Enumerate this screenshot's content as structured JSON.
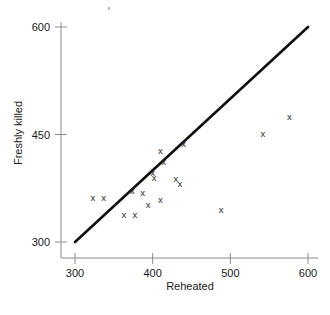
{
  "chart_data": {
    "type": "scatter",
    "title": "",
    "xlabel": "Reheated",
    "ylabel": "Freshly killed",
    "xlim": [
      285,
      615
    ],
    "ylim": [
      285,
      615
    ],
    "xticks": [
      300,
      400,
      500,
      600
    ],
    "yticks": [
      300,
      450,
      600
    ],
    "xtick_labels": [
      "300",
      "400",
      "500",
      "600"
    ],
    "ytick_labels": [
      "300",
      "450",
      "600"
    ],
    "grid": false,
    "legend": null,
    "marker_symbol": "x",
    "points": [
      {
        "x": 323,
        "y": 362
      },
      {
        "x": 337,
        "y": 362
      },
      {
        "x": 363,
        "y": 338
      },
      {
        "x": 377,
        "y": 338
      },
      {
        "x": 374,
        "y": 372
      },
      {
        "x": 387,
        "y": 369
      },
      {
        "x": 394,
        "y": 352
      },
      {
        "x": 400,
        "y": 397
      },
      {
        "x": 402,
        "y": 390
      },
      {
        "x": 410,
        "y": 359
      },
      {
        "x": 410,
        "y": 427
      },
      {
        "x": 414,
        "y": 412
      },
      {
        "x": 430,
        "y": 388
      },
      {
        "x": 435,
        "y": 381
      },
      {
        "x": 440,
        "y": 437
      },
      {
        "x": 488,
        "y": 345
      },
      {
        "x": 542,
        "y": 451
      },
      {
        "x": 576,
        "y": 475
      }
    ],
    "reference_line": {
      "label": "y = x identity line",
      "x_start": 300,
      "y_start": 300,
      "x_end": 600,
      "y_end": 600
    }
  }
}
